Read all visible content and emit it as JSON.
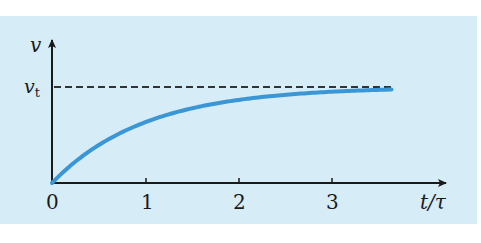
{
  "chart_data": {
    "type": "line",
    "title": "",
    "xlabel": "t/τ",
    "ylabel": "v",
    "x_ticks": [
      "0",
      "1",
      "2",
      "3"
    ],
    "y_ticks": [
      "v_t"
    ],
    "xlim": [
      0,
      4.2
    ],
    "ylim": [
      0,
      1.5
    ],
    "grid": false,
    "legend": null,
    "annotations": [
      {
        "type": "hline",
        "y": 1.0,
        "label": "v_t",
        "style": "dashed",
        "x_end": 3.65
      }
    ],
    "series": [
      {
        "name": "v(t) = v_t (1 - e^(-t/τ))",
        "x": [
          0,
          0.25,
          0.5,
          0.75,
          1.0,
          1.5,
          2.0,
          2.5,
          3.0,
          3.5,
          3.65
        ],
        "values": [
          0,
          0.22,
          0.39,
          0.53,
          0.63,
          0.78,
          0.86,
          0.92,
          0.95,
          0.97,
          0.97
        ]
      }
    ]
  },
  "labels": {
    "y_axis": "v",
    "vt_main": "v",
    "vt_sub": "t",
    "x_axis": "t/τ",
    "tick0": "0",
    "tick1": "1",
    "tick2": "2",
    "tick3": "3"
  },
  "colors": {
    "panel": "#d6ecf7",
    "curve": "#3a96d4",
    "axes": "#1a1a1a"
  }
}
